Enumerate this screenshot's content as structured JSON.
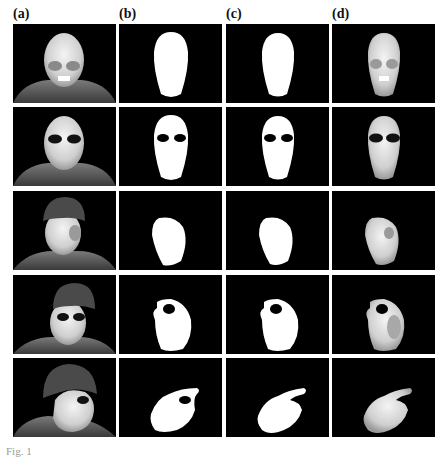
{
  "figure": {
    "column_labels": [
      "(a)",
      "(b)",
      "(c)",
      "(d)"
    ],
    "columns": [
      {
        "label": "(a)",
        "content": "thermal image"
      },
      {
        "label": "(b)",
        "content": "binary face mask"
      },
      {
        "label": "(c)",
        "content": "binary face mask (refined)"
      },
      {
        "label": "(d)",
        "content": "segmented thermal face"
      }
    ],
    "rows": [
      {
        "index": 1,
        "pose": "frontal",
        "glasses": false
      },
      {
        "index": 2,
        "pose": "frontal",
        "glasses": true
      },
      {
        "index": 3,
        "pose": "turned",
        "glasses": false,
        "hat": true
      },
      {
        "index": 4,
        "pose": "turned",
        "glasses": true,
        "hat": true
      },
      {
        "index": 5,
        "pose": "profile",
        "glasses": true,
        "hat": true
      }
    ],
    "caption": "Fig. 1"
  }
}
